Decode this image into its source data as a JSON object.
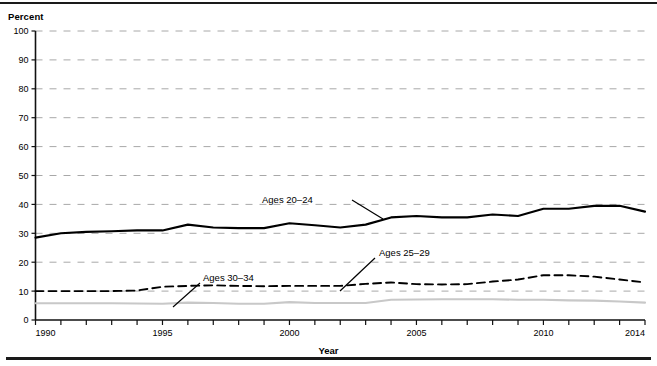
{
  "figure": {
    "clipped_title": "Figure 1. Percentage of people living in poverty by age group, 1990-2014",
    "y_unit_label": "Percent",
    "x_axis_title": "Year"
  },
  "chart_data": {
    "type": "line",
    "title": "",
    "xlabel": "Year",
    "ylabel": "Percent",
    "xlim": [
      1990,
      2014
    ],
    "ylim": [
      0,
      100
    ],
    "ytick_values": [
      0,
      10,
      20,
      30,
      40,
      50,
      60,
      70,
      80,
      90,
      100
    ],
    "ytick_labels": [
      "0",
      "10",
      "20",
      "30",
      "40",
      "50",
      "60",
      "70",
      "80",
      "90",
      "100"
    ],
    "xtick_values": [
      1990,
      1991,
      1992,
      1993,
      1994,
      1995,
      1996,
      1997,
      1998,
      1999,
      2000,
      2001,
      2002,
      2003,
      2004,
      2005,
      2006,
      2007,
      2008,
      2009,
      2010,
      2011,
      2012,
      2013,
      2014
    ],
    "xtick_labels_shown": [
      "1990",
      "1995",
      "2000",
      "2005",
      "2010",
      "2014"
    ],
    "grid": "horizontal-dashed",
    "legend_position": "inline-annotations",
    "x": [
      1990,
      1991,
      1992,
      1993,
      1994,
      1995,
      1996,
      1997,
      1998,
      1999,
      2000,
      2001,
      2002,
      2003,
      2004,
      2005,
      2006,
      2007,
      2008,
      2009,
      2010,
      2011,
      2012,
      2013,
      2014
    ],
    "series": [
      {
        "name": "Ages 20-24",
        "label": "Ages 20–24",
        "style": "solid",
        "color": "#000000",
        "width": 2.1,
        "values": [
          28.5,
          30.0,
          30.5,
          30.7,
          31.0,
          31.0,
          33.0,
          32.0,
          31.8,
          31.8,
          33.5,
          32.8,
          32.0,
          33.0,
          35.5,
          36.0,
          35.5,
          35.5,
          36.5,
          36.0,
          38.5,
          38.5,
          39.5,
          39.5,
          37.5
        ]
      },
      {
        "name": "Ages 25-29",
        "label": "Ages 25–29",
        "style": "dashed",
        "color": "#000000",
        "width": 1.9,
        "values": [
          10.0,
          10.0,
          10.0,
          10.0,
          10.2,
          11.5,
          11.8,
          12.0,
          11.8,
          11.7,
          11.8,
          11.8,
          11.8,
          12.5,
          13.0,
          12.4,
          12.3,
          12.4,
          13.3,
          14.0,
          15.5,
          15.5,
          15.0,
          14.0,
          13.0
        ]
      },
      {
        "name": "Ages 30-34",
        "label": "Ages 30–34",
        "style": "solid",
        "color": "#c8c8c8",
        "width": 2.1,
        "values": [
          5.8,
          5.8,
          5.8,
          5.8,
          5.7,
          5.6,
          6.0,
          5.9,
          5.6,
          5.6,
          6.2,
          5.9,
          5.9,
          5.9,
          7.0,
          7.1,
          7.2,
          7.2,
          7.2,
          7.0,
          7.0,
          6.8,
          6.7,
          6.4,
          6.0
        ]
      }
    ],
    "annotations": [
      {
        "name": "ages-20-24-callout",
        "text": "Ages 20–24",
        "text_x": 262,
        "text_y": 203,
        "leader": [
          [
            352,
            200
          ],
          [
            383,
            219
          ]
        ]
      },
      {
        "name": "ages-25-29-callout",
        "text": "Ages 25–29",
        "text_x": 379,
        "text_y": 256,
        "leader": [
          [
            375,
            258
          ],
          [
            340,
            291
          ]
        ]
      },
      {
        "name": "ages-30-34-callout",
        "text": "Ages 30–34",
        "text_x": 203,
        "text_y": 281,
        "leader": [
          [
            200,
            283
          ],
          [
            173,
            307
          ]
        ]
      }
    ]
  }
}
